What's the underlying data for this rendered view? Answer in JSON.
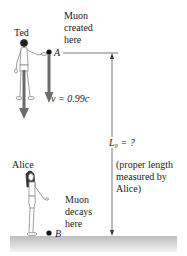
{
  "labels": {
    "ted": "Ted",
    "alice": "Alice",
    "muon_created": [
      "Muon",
      "created",
      "here"
    ],
    "muon_decays": [
      "Muon",
      "decays",
      "here"
    ],
    "point_a": "A",
    "point_b": "B",
    "velocity": "v = 0.99c",
    "length": "L₀ = ?",
    "proper_length_note": [
      "(proper length",
      "measured by",
      "Alice)"
    ]
  },
  "colors": {
    "arrow": "#6b6b6b",
    "line": "#555555",
    "ground": "#cfcfcf",
    "text": "#222222"
  }
}
